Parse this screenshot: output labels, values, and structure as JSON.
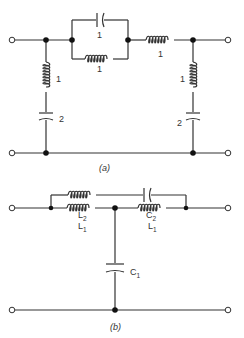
{
  "colors": {
    "wire": "#333333",
    "text": "#333333",
    "background": "#ffffff"
  },
  "circuit_a": {
    "caption": "(a)",
    "series_parallel_capacitor_label": "1",
    "series_parallel_inductor_label": "1",
    "series_inductor_label": "1",
    "left_shunt_inductor_label": "1",
    "left_shunt_capacitor_label": "2",
    "right_shunt_inductor_label": "1",
    "right_shunt_capacitor_label": "2"
  },
  "circuit_b": {
    "caption": "(b)",
    "L2_label": "L",
    "L2_sub": "2",
    "C2_label": "C",
    "C2_sub": "2",
    "L1_left_label": "L",
    "L1_left_sub": "1",
    "L1_right_label": "L",
    "L1_right_sub": "1",
    "C1_label": "C",
    "C1_sub": "1"
  }
}
